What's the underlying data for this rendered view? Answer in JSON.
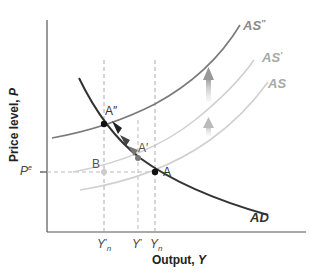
{
  "diagram": {
    "title": "",
    "axes": {
      "y_label": "Price level, P",
      "y_label_prefix": "Price level, ",
      "y_label_var": "P",
      "x_label": "Output, Y",
      "x_label_prefix": "Output, ",
      "x_label_var": "Y"
    },
    "y_ticks": [
      {
        "label": "P",
        "superscript": "e"
      }
    ],
    "x_ticks": [
      {
        "label": "Y",
        "subscript": "n",
        "prime": "′"
      },
      {
        "label": "Y",
        "prime": "′"
      },
      {
        "label": "Y",
        "subscript": "n"
      }
    ],
    "curves": [
      {
        "name": "AD",
        "label": "AD",
        "color": "#333333",
        "style": "solid-dark"
      },
      {
        "name": "AS",
        "label": "AS",
        "color": "#c8c8c8",
        "style": "solid-light"
      },
      {
        "name": "AS_prime",
        "label": "AS",
        "label_prime": "′",
        "color": "#c8c8c8",
        "style": "solid-light"
      },
      {
        "name": "AS_double_prime",
        "label": "AS",
        "label_prime": "″",
        "color": "#7a7a7a",
        "style": "solid-medium"
      }
    ],
    "points": [
      {
        "name": "A",
        "label": "A",
        "color": "#111111"
      },
      {
        "name": "A_prime",
        "label": "A′",
        "color": "#777777"
      },
      {
        "name": "A_double_prime",
        "label": "A″",
        "color": "#111111"
      },
      {
        "name": "B",
        "label": "B",
        "color": "#c8c8c8"
      }
    ],
    "arrows": [
      {
        "name": "shift-up-arrow-small",
        "direction": "up",
        "color": "#bbbbbb"
      },
      {
        "name": "shift-up-arrow-large",
        "direction": "up",
        "color": "#999999"
      },
      {
        "name": "ad-movement-arrows",
        "direction": "up-left along AD",
        "color": "#333333"
      }
    ]
  }
}
